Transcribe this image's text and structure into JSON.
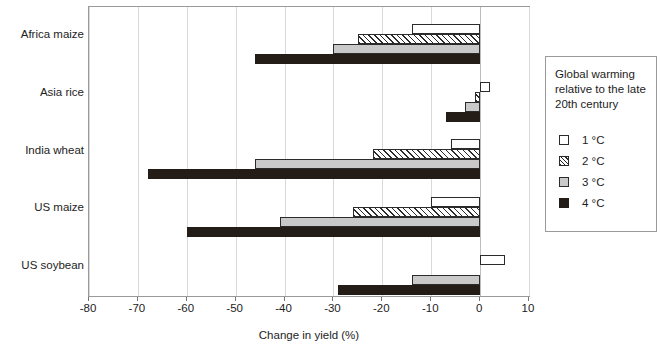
{
  "chart_data": {
    "type": "bar",
    "orientation": "horizontal",
    "title": "",
    "xlabel": "Change in yield (%)",
    "ylabel": "",
    "xlim": [
      -80,
      10
    ],
    "xticks": [
      -80,
      -70,
      -60,
      -50,
      -40,
      -30,
      -20,
      -10,
      0,
      10
    ],
    "xtick_labels": [
      "-80",
      "-70",
      "-60",
      "-50",
      "-40",
      "-30",
      "-20",
      "-10",
      "0",
      "10"
    ],
    "grid": true,
    "categories": [
      "Africa maize",
      "Asia rice",
      "India wheat",
      "US maize",
      "US soybean"
    ],
    "series": [
      {
        "name": "1 °C",
        "swatch": "s1",
        "color": "#ffffff",
        "values": [
          -14,
          2,
          -6,
          -10,
          5
        ]
      },
      {
        "name": "2 °C",
        "swatch": "s2",
        "color": "#ffffff",
        "values": [
          -25,
          -1,
          -22,
          -26,
          0
        ]
      },
      {
        "name": "3 °C",
        "swatch": "s3",
        "color": "#c9c9c9",
        "values": [
          -30,
          -3,
          -46,
          -41,
          -14
        ]
      },
      {
        "name": "4 °C",
        "swatch": "s4",
        "color": "#241c16",
        "values": [
          -46,
          -7,
          -68,
          -60,
          -29
        ]
      }
    ]
  },
  "legend": {
    "title": "Global warming relative to the late 20th century",
    "items": [
      {
        "label": "1 °C",
        "swatch": "s1"
      },
      {
        "label": "2 °C",
        "swatch": "s2"
      },
      {
        "label": "3 °C",
        "swatch": "s3"
      },
      {
        "label": "4 °C",
        "swatch": "s4"
      }
    ]
  }
}
